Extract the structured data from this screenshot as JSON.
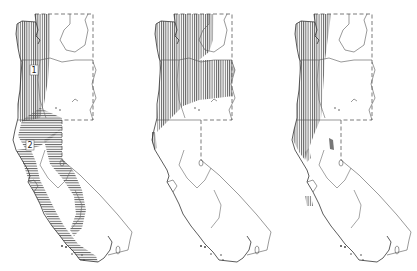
{
  "figure": {
    "panels": [
      {
        "id": "map-1",
        "offset_x": 0,
        "zone_labels": [
          "1",
          "2"
        ]
      },
      {
        "id": "map-2",
        "offset_x": 139,
        "zone_labels": []
      },
      {
        "id": "map-3",
        "offset_x": 279,
        "zone_labels": []
      }
    ],
    "colors": {
      "ink": "#333333",
      "hatch": "#555555",
      "background": "#ffffff"
    }
  }
}
